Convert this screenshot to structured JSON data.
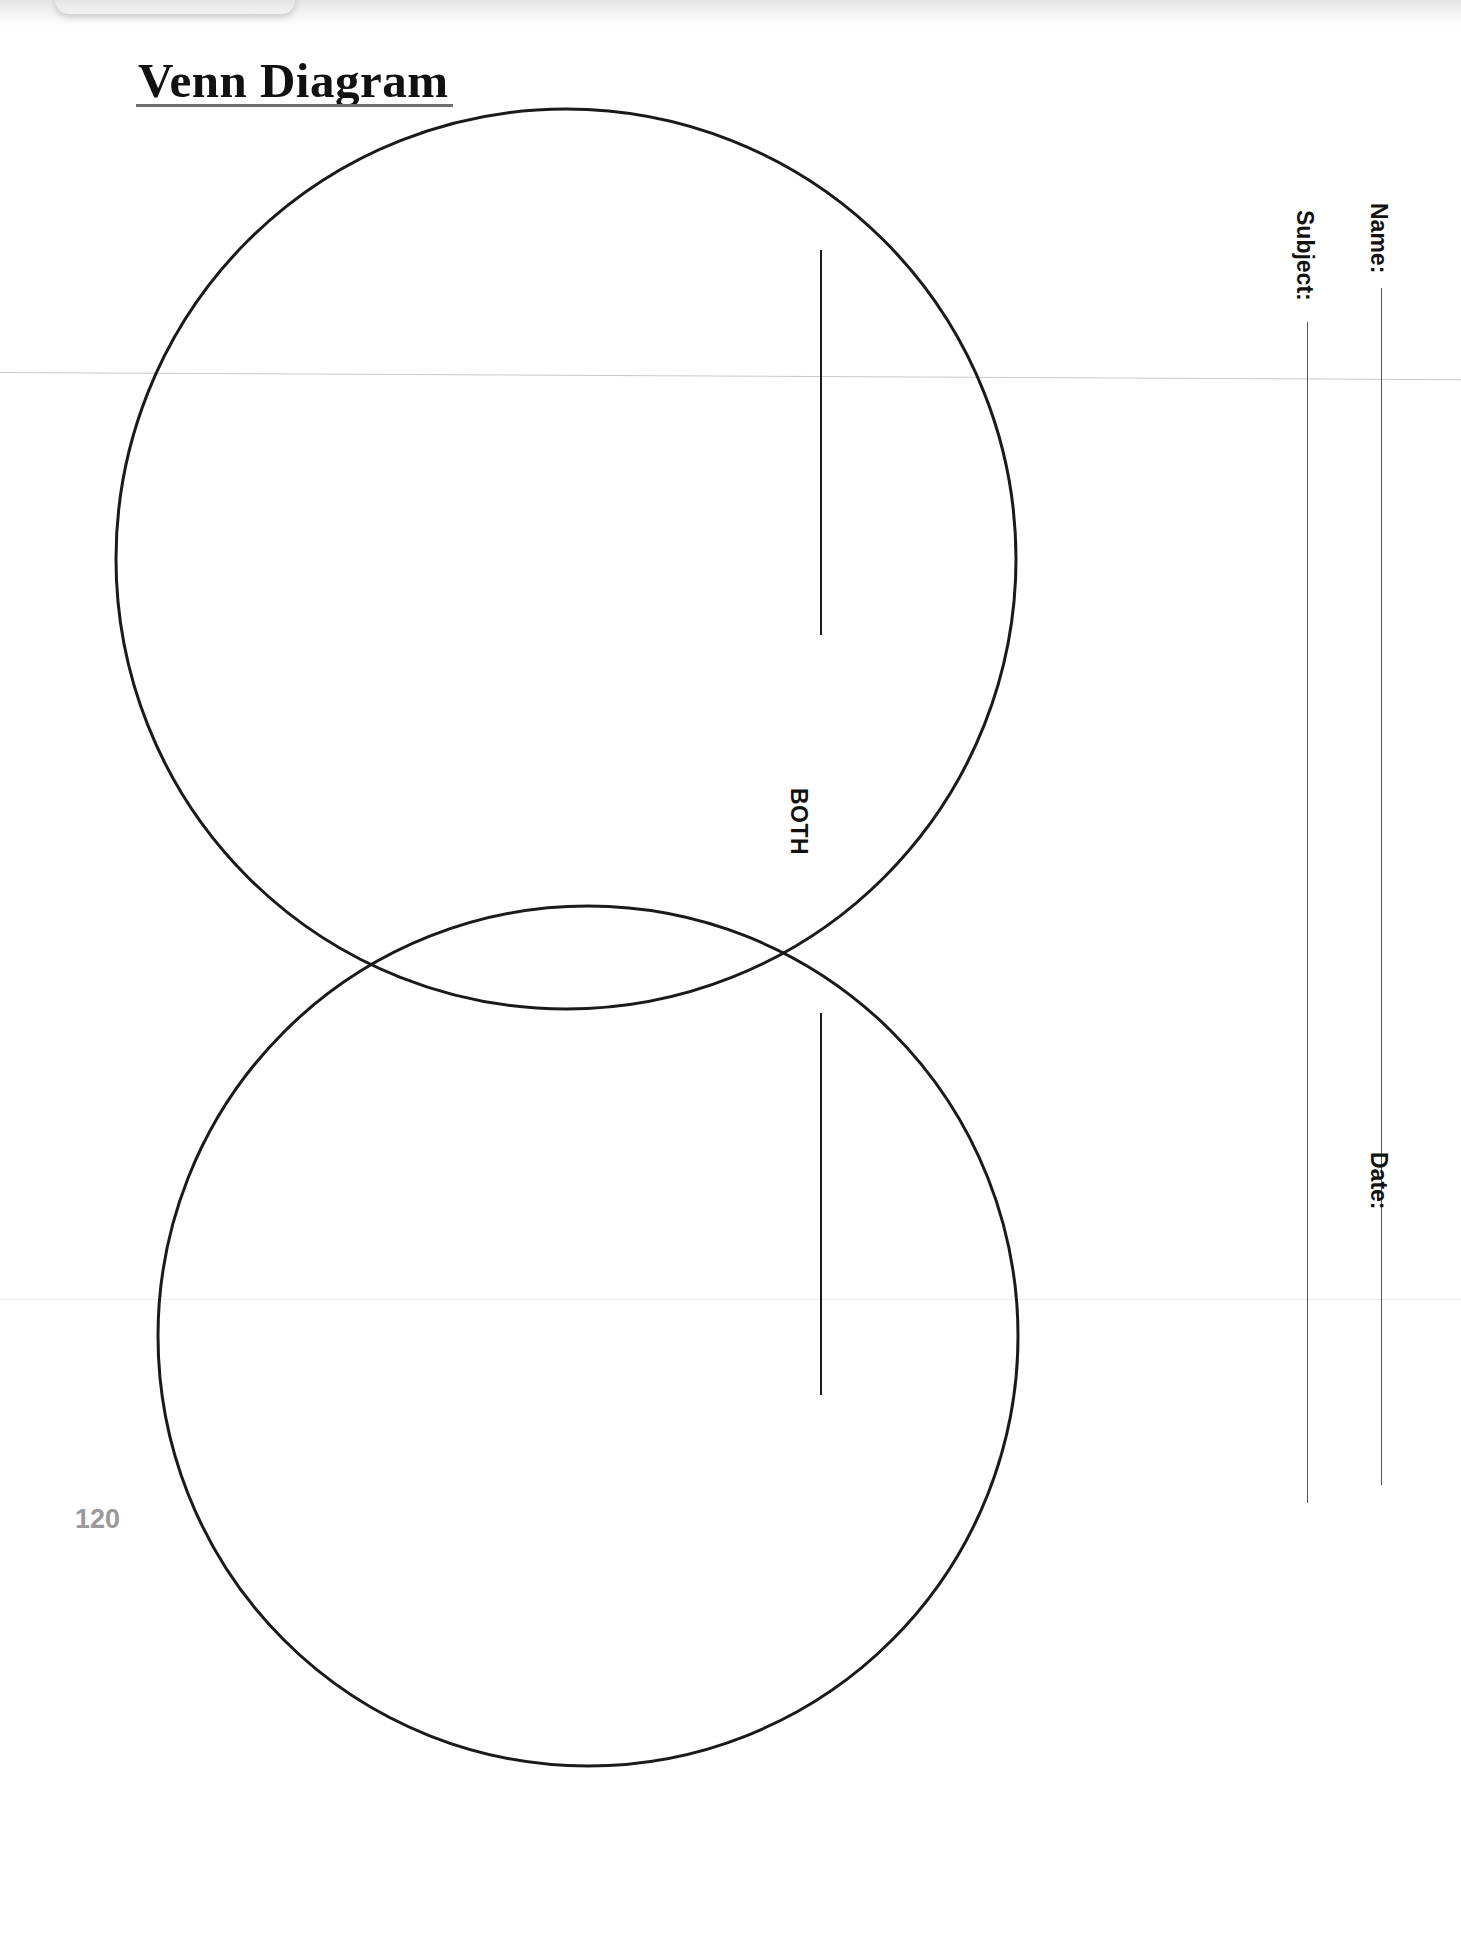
{
  "document": {
    "title": "Venn Diagram",
    "page_number": "120",
    "type": "worksheet-template"
  },
  "top_chip": {
    "partial_text": "p    g"
  },
  "diagram": {
    "center_label": "BOTH",
    "circles": [
      {
        "name": "top-circle",
        "cx": 566,
        "cy": 559,
        "r": 450
      },
      {
        "name": "bottom-circle",
        "cx": 588,
        "cy": 1336,
        "r": 430
      }
    ],
    "write_in_rules": [
      {
        "name": "top-circle-rule"
      },
      {
        "name": "bottom-circle-rule"
      }
    ]
  },
  "form": {
    "fields": [
      {
        "key": "name",
        "label": "Name:",
        "value": ""
      },
      {
        "key": "subject",
        "label": "Subject:",
        "value": ""
      },
      {
        "key": "date",
        "label": "Date:",
        "value": ""
      }
    ]
  },
  "colors": {
    "ink": "#111111",
    "rule": "#1a1a1a",
    "form_rule": "#555555",
    "title_underline": "#6f6f6f",
    "page_number": "#9a9a9a",
    "paper": "#ffffff",
    "fold": "#d9d9d9"
  }
}
